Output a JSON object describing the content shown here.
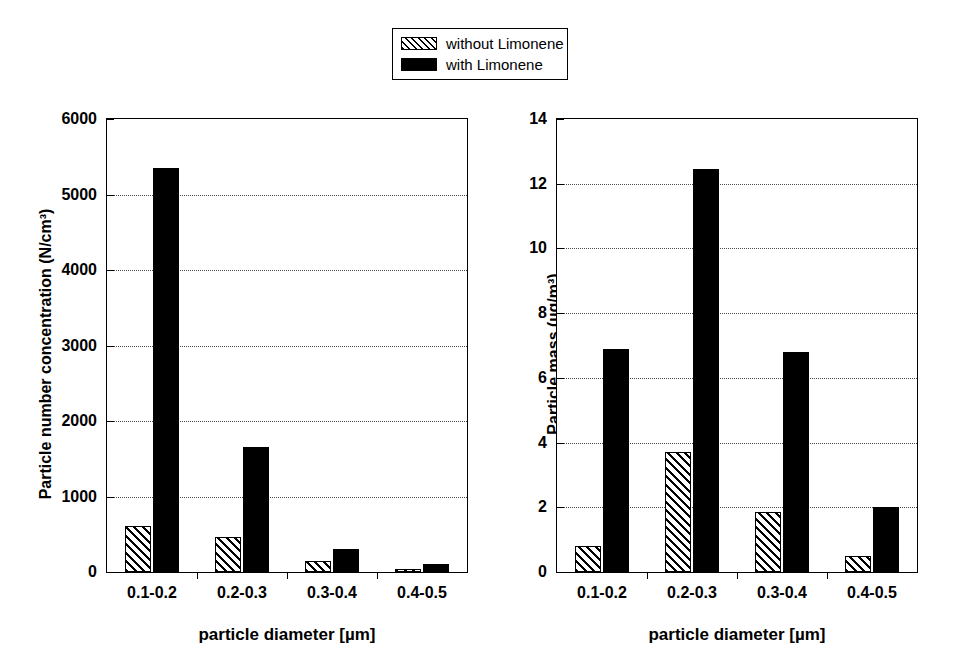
{
  "legend": {
    "items": [
      {
        "label": "without Limonene",
        "style": "hatched"
      },
      {
        "label": "with Limonene",
        "style": "solid"
      }
    ]
  },
  "chart_data": [
    {
      "type": "bar",
      "panel": "left",
      "title": "",
      "xlabel": "particle diameter [µm]",
      "ylabel": "Particle number concentration (N/cm³)",
      "categories": [
        "0.1-0.2",
        "0.2-0.3",
        "0.3-0.4",
        "0.4-0.5"
      ],
      "yticks": [
        0,
        1000,
        2000,
        3000,
        4000,
        5000,
        6000
      ],
      "ylim": [
        0,
        6000
      ],
      "grid": true,
      "legend_position": "top-center",
      "series": [
        {
          "name": "without Limonene",
          "style": "hatched",
          "values": [
            605,
            460,
            150,
            45
          ]
        },
        {
          "name": "with Limonene",
          "style": "solid",
          "values": [
            5355,
            1650,
            310,
            110
          ]
        }
      ]
    },
    {
      "type": "bar",
      "panel": "right",
      "title": "",
      "xlabel": "particle diameter [µm]",
      "ylabel": "Particle mass (µg/m³)",
      "categories": [
        "0.1-0.2",
        "0.2-0.3",
        "0.3-0.4",
        "0.4-0.5"
      ],
      "yticks": [
        0,
        2,
        4,
        6,
        8,
        10,
        12,
        14
      ],
      "ylim": [
        0,
        14
      ],
      "grid": true,
      "legend_position": "top-center",
      "series": [
        {
          "name": "without Limonene",
          "style": "hatched",
          "values": [
            0.8,
            3.7,
            1.85,
            0.5
          ]
        },
        {
          "name": "with Limonene",
          "style": "solid",
          "values": [
            6.9,
            12.45,
            6.8,
            2.0
          ]
        }
      ]
    }
  ],
  "colors": {
    "axis": "#000000",
    "grid": "#4a4a4a",
    "series_solid": "#000000",
    "series_hatched": "#ffffff",
    "background": "#ffffff"
  }
}
